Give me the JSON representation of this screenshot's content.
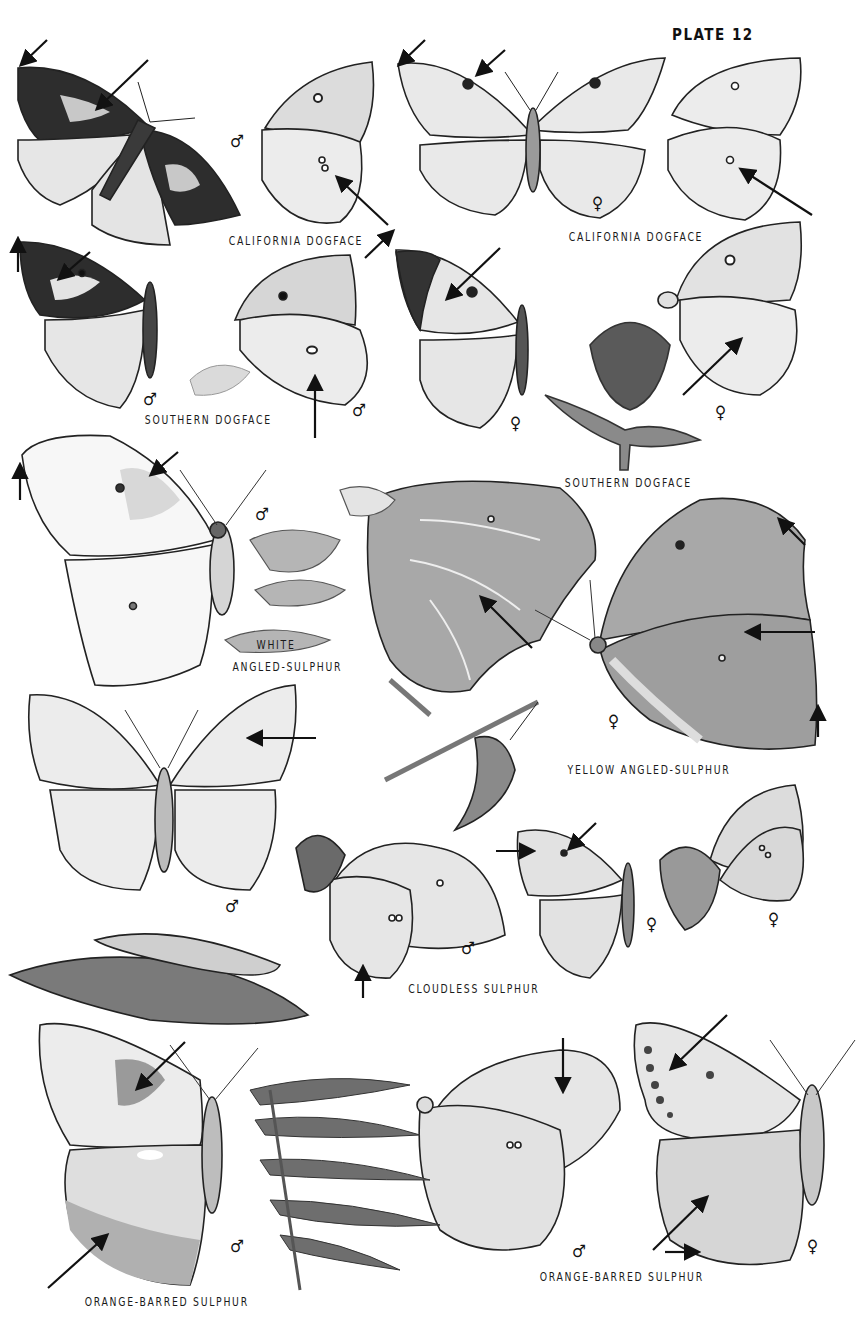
{
  "plate": {
    "title": "PLATE 12"
  },
  "labels": {
    "california_dogface_male": "CALIFORNIA DOGFACE",
    "california_dogface_female": "CALIFORNIA DOGFACE",
    "southern_dogface_male": "SOUTHERN DOGFACE",
    "southern_dogface_female": "SOUTHERN DOGFACE",
    "white_angled_sulphur_line1": "WHITE",
    "white_angled_sulphur_line2": "ANGLED-SULPHUR",
    "yellow_angled_sulphur": "YELLOW ANGLED-SULPHUR",
    "cloudless_sulphur": "CLOUDLESS SULPHUR",
    "orange_barred_sulphur_male": "ORANGE-BARRED SULPHUR",
    "orange_barred_sulphur_female": "ORANGE-BARRED SULPHUR"
  },
  "sex_symbols": {
    "male": "♂",
    "female": "♀"
  },
  "specimens": [
    {
      "species": "California Dogface",
      "sex": "male",
      "view": "upperside"
    },
    {
      "species": "California Dogface",
      "sex": "male",
      "view": "underside"
    },
    {
      "species": "California Dogface",
      "sex": "female",
      "view": "upperside"
    },
    {
      "species": "California Dogface",
      "sex": "female",
      "view": "underside"
    },
    {
      "species": "Southern Dogface",
      "sex": "male",
      "view": "upperside"
    },
    {
      "species": "Southern Dogface",
      "sex": "male",
      "view": "underside"
    },
    {
      "species": "Southern Dogface",
      "sex": "female",
      "view": "upperside"
    },
    {
      "species": "Southern Dogface",
      "sex": "female",
      "view": "underside"
    },
    {
      "species": "White Angled-Sulphur",
      "sex": "male",
      "view": "upperside"
    },
    {
      "species": "White Angled-Sulphur",
      "sex": "",
      "view": "underside"
    },
    {
      "species": "Yellow Angled-Sulphur",
      "sex": "female",
      "view": "underside"
    },
    {
      "species": "Cloudless Sulphur",
      "sex": "male",
      "view": "upperside"
    },
    {
      "species": "Cloudless Sulphur",
      "sex": "male",
      "view": "underside"
    },
    {
      "species": "Cloudless Sulphur",
      "sex": "female",
      "view": "upperside"
    },
    {
      "species": "Cloudless Sulphur",
      "sex": "female",
      "view": "underside"
    },
    {
      "species": "Orange-barred Sulphur",
      "sex": "male",
      "view": "underside"
    },
    {
      "species": "Orange-barred Sulphur",
      "sex": "male",
      "view": "underside"
    },
    {
      "species": "Orange-barred Sulphur",
      "sex": "female",
      "view": "underside"
    }
  ],
  "colors": {
    "ink": "#1a1a1a",
    "wing_light": "#ececec",
    "wing_mid": "#cfcfcf",
    "wing_dark": "#2b2b2b",
    "plant": "#7a7a7a"
  }
}
